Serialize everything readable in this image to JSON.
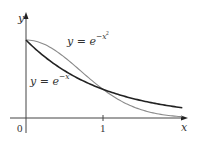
{
  "chart_data": {
    "type": "line",
    "title": "",
    "xlabel": "x",
    "ylabel": "y",
    "xlim": [
      0,
      2.08
    ],
    "ylim": [
      0,
      1.33
    ],
    "grid": false,
    "legend": "none (inline curve labels)",
    "x_ticks": [
      {
        "value": 0,
        "label": "0"
      },
      {
        "value": 1,
        "label": "1"
      }
    ],
    "series": [
      {
        "name": "y = e^{-x}",
        "label_main": "y = e",
        "label_exp": "−x",
        "color": "#222222",
        "stroke_width": 1.6,
        "x": [
          0,
          0.25,
          0.5,
          0.75,
          1.0,
          1.25,
          1.5,
          1.75,
          2.03
        ],
        "values": [
          1.0,
          0.779,
          0.607,
          0.472,
          0.368,
          0.287,
          0.223,
          0.174,
          0.131
        ]
      },
      {
        "name": "y = e^{-x^2}",
        "label_main": "y = e",
        "label_exp": "−x",
        "label_exp2": "2",
        "color": "#8a8a8a",
        "stroke_width": 1.1,
        "x": [
          0,
          0.25,
          0.5,
          0.75,
          1.0,
          1.25,
          1.5,
          1.75,
          2.03
        ],
        "values": [
          1.0,
          0.939,
          0.779,
          0.57,
          0.368,
          0.21,
          0.105,
          0.047,
          0.016
        ]
      }
    ],
    "annotations": [
      "y = e^{-x^2}",
      "y = e^{-x}"
    ]
  },
  "axes": {
    "x_label": "x",
    "y_label": "y",
    "origin_label": "0",
    "tick_one_label": "1"
  },
  "labels": {
    "gauss_main": "y = e",
    "gauss_exp": "−x",
    "gauss_exp2": "2",
    "exp_main": "y = e",
    "exp_exp": "−x"
  }
}
